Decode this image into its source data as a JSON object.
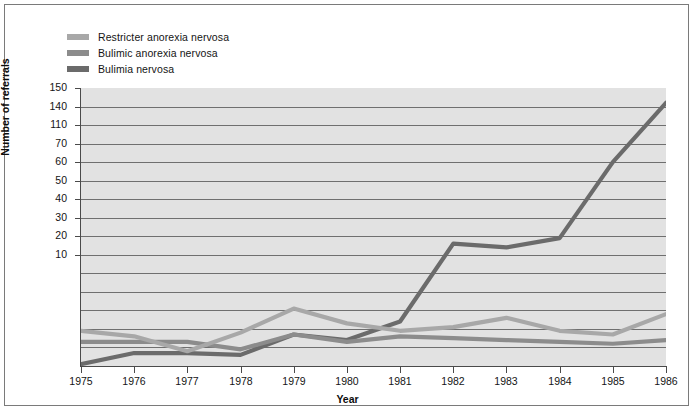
{
  "figure": {
    "y_axis_title": "Number of referrals",
    "x_axis_title": "Year"
  },
  "legend": {
    "items": [
      {
        "label": "Restricter anorexia nervosa",
        "color": "#a8a8a8"
      },
      {
        "label": "Bulimic anorexia nervosa",
        "color": "#8c8c8c"
      },
      {
        "label": "Bulimia nervosa",
        "color": "#6b6b6b"
      }
    ]
  },
  "chart_data": {
    "type": "line",
    "title": "",
    "subtitle": "",
    "xlabel": "Year",
    "ylabel": "Number of referrals",
    "grid": true,
    "legend_position": "top-left",
    "plot_background": "#e2e2e2",
    "x": [
      1975,
      1976,
      1977,
      1978,
      1979,
      1980,
      1981,
      1982,
      1983,
      1984,
      1985,
      1986
    ],
    "xtick_labels": [
      "1975",
      "1976",
      "1977",
      "1978",
      "1979",
      "1980",
      "1981",
      "1982",
      "1983",
      "1984",
      "1985",
      "1986"
    ],
    "ytick_labels": [
      "150",
      "140",
      "110",
      "70",
      "60",
      "50",
      "40",
      "30",
      "20",
      "10"
    ],
    "ytick_values": [
      150,
      140,
      130,
      120,
      110,
      100,
      90,
      80,
      70,
      60,
      50,
      40,
      30,
      20,
      10
    ],
    "ylim": [
      0,
      150
    ],
    "series": [
      {
        "name": "Restricter anorexia nervosa",
        "color": "#a8a8a8",
        "values": [
          19,
          16,
          8,
          18,
          31,
          23,
          19,
          21,
          26,
          19,
          17,
          28
        ]
      },
      {
        "name": "Bulimic anorexia nervosa",
        "color": "#8c8c8c",
        "values": [
          13,
          13,
          13,
          9,
          17,
          13,
          16,
          15,
          14,
          13,
          12,
          14
        ]
      },
      {
        "name": "Bulimia nervosa",
        "color": "#6b6b6b",
        "values": [
          1,
          7,
          7,
          6,
          17,
          14,
          24,
          66,
          64,
          69,
          110,
          142
        ]
      }
    ]
  }
}
